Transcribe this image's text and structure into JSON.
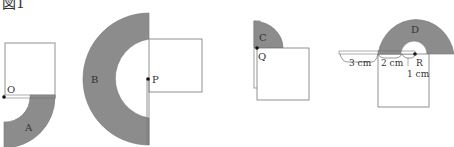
{
  "figure": {
    "title": "図1",
    "colors": {
      "shade": "#8c8c8c",
      "stroke": "#555555",
      "fill": "#ffffff"
    },
    "labels": {
      "A": "A",
      "B": "B",
      "C": "C",
      "D": "D",
      "O": "O",
      "P": "P",
      "Q": "Q",
      "R": "R"
    },
    "dimensions": {
      "d1": "3 cm",
      "d2": "2 cm",
      "d3": "1 cm"
    }
  }
}
